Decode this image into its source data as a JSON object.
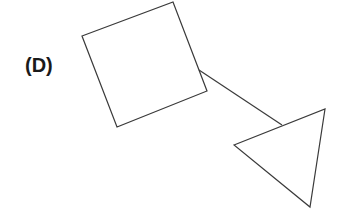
{
  "diagram": {
    "label": "(D)",
    "shapes": [
      {
        "name": "square",
        "type": "quadrilateral",
        "points": [
          [
            82,
            36
          ],
          [
            173,
            2
          ],
          [
            207,
            91
          ],
          [
            117,
            127
          ]
        ]
      },
      {
        "name": "triangle",
        "type": "triangle",
        "points": [
          [
            234,
            145
          ],
          [
            325,
            109
          ],
          [
            310,
            207
          ]
        ]
      }
    ],
    "connector": {
      "from": "square",
      "to": "triangle",
      "start": [
        199,
        70
      ],
      "end": [
        282,
        125
      ]
    },
    "colors": {
      "stroke": "#3a3a3a",
      "label": "#1a1a1a",
      "background": "#ffffff"
    }
  }
}
